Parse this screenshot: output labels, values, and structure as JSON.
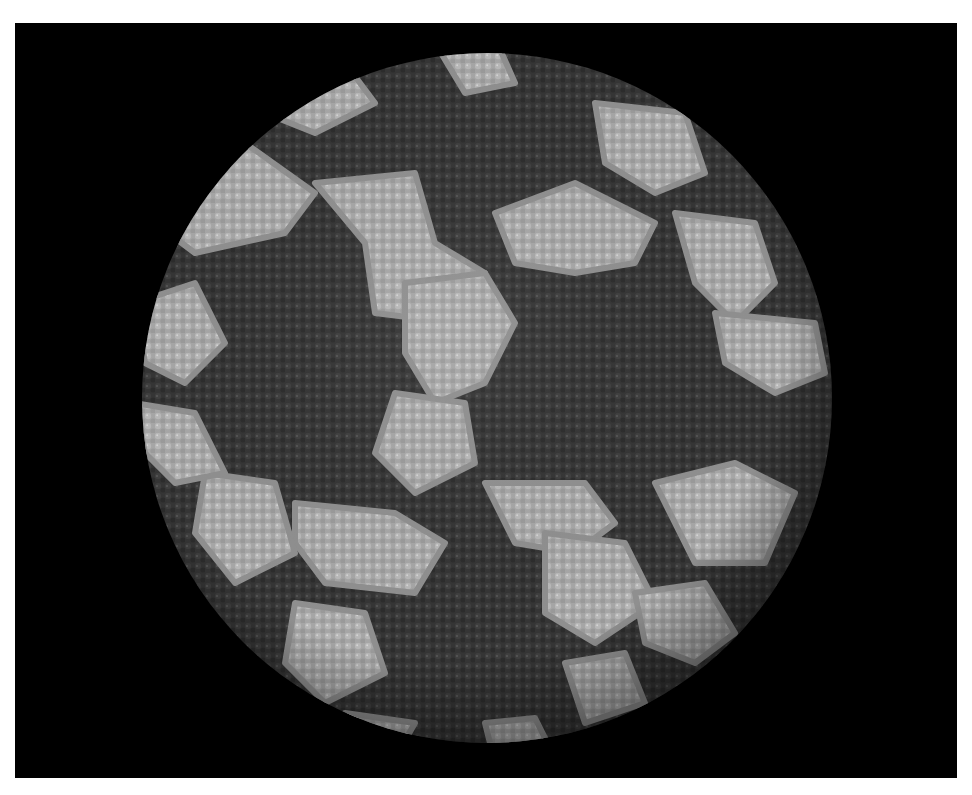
{
  "image": {
    "description": "Space-filling molecular rendering of an icosahedral virus capsid on black background",
    "background": "#ffffff",
    "panel": {
      "x": 15,
      "y": 23,
      "width": 942,
      "height": 755,
      "color": "#000000"
    },
    "sphere": {
      "cx": 472,
      "cy": 375,
      "r": 345
    },
    "colors": {
      "dark_subunits": "#3a3a3a",
      "dark_shadow": "#262626",
      "light_subunits": "#a9a9a9",
      "light_highlight": "#c4c4c4"
    },
    "light_patches": [
      [
        150,
        140,
        230,
        120,
        300,
        170,
        270,
        210,
        180,
        230,
        140,
        200
      ],
      [
        300,
        160,
        400,
        150,
        420,
        220,
        470,
        250,
        440,
        300,
        360,
        290,
        350,
        220
      ],
      [
        480,
        190,
        560,
        160,
        640,
        200,
        620,
        240,
        560,
        250,
        500,
        240
      ],
      [
        580,
        80,
        670,
        90,
        690,
        150,
        640,
        170,
        590,
        140
      ],
      [
        660,
        190,
        740,
        200,
        760,
        260,
        720,
        300,
        680,
        260
      ],
      [
        700,
        290,
        800,
        300,
        810,
        350,
        760,
        370,
        710,
        340
      ],
      [
        120,
        280,
        180,
        260,
        210,
        320,
        170,
        360,
        130,
        340
      ],
      [
        390,
        260,
        470,
        250,
        500,
        300,
        470,
        360,
        420,
        380,
        390,
        330
      ],
      [
        380,
        370,
        450,
        380,
        460,
        440,
        400,
        470,
        360,
        430
      ],
      [
        470,
        460,
        570,
        460,
        600,
        500,
        560,
        530,
        500,
        520
      ],
      [
        530,
        510,
        610,
        520,
        640,
        580,
        580,
        620,
        530,
        590
      ],
      [
        280,
        480,
        380,
        490,
        430,
        520,
        400,
        570,
        310,
        560,
        280,
        520
      ],
      [
        190,
        450,
        260,
        460,
        280,
        530,
        220,
        560,
        180,
        510
      ],
      [
        120,
        380,
        180,
        390,
        210,
        450,
        160,
        460,
        130,
        430
      ],
      [
        640,
        460,
        720,
        440,
        780,
        470,
        750,
        540,
        680,
        540
      ],
      [
        620,
        570,
        690,
        560,
        720,
        610,
        680,
        640,
        630,
        620
      ],
      [
        280,
        580,
        350,
        590,
        370,
        650,
        310,
        680,
        270,
        640
      ],
      [
        550,
        640,
        610,
        630,
        630,
        680,
        570,
        700
      ],
      [
        250,
        50,
        330,
        40,
        360,
        80,
        300,
        110,
        250,
        90
      ],
      [
        420,
        20,
        480,
        15,
        500,
        60,
        450,
        70
      ],
      [
        330,
        690,
        400,
        700,
        380,
        735,
        330,
        725
      ],
      [
        470,
        700,
        520,
        695,
        540,
        735,
        480,
        740
      ]
    ]
  }
}
